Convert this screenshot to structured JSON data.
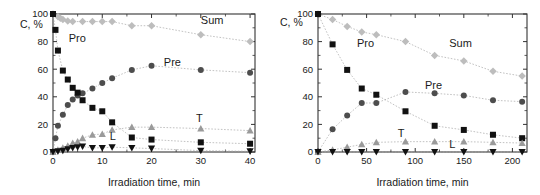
{
  "figure": {
    "background": "#ffffff",
    "panel_count": 2
  },
  "colors": {
    "pro": "#111111",
    "pre": "#4d4d4d",
    "sum": "#bdbdbd",
    "t": "#9a9a9a",
    "l": "#111111",
    "axis": "#333333",
    "connector": "#a8a8a8",
    "text": "#1a1a1a"
  },
  "series_meta": [
    {
      "key": "sum",
      "label": "Sum",
      "marker": "diamond",
      "color": "#bdbdbd"
    },
    {
      "key": "pre",
      "label": "Pre",
      "marker": "circle",
      "color": "#4d4d4d"
    },
    {
      "key": "pro",
      "label": "Pro",
      "marker": "square",
      "color": "#111111"
    },
    {
      "key": "t",
      "label": "T",
      "marker": "triangle-up",
      "color": "#9a9a9a"
    },
    {
      "key": "l",
      "label": "L",
      "marker": "triangle-down",
      "color": "#111111"
    }
  ],
  "chart_data": [
    {
      "type": "scatter",
      "panel": "left",
      "title": "",
      "xlabel": "Irradiation time, min",
      "ylabel": "C, %",
      "xlim": [
        0,
        41
      ],
      "ylim": [
        0,
        100
      ],
      "xticks": [
        0,
        10,
        20,
        30,
        40
      ],
      "yticks": [
        0,
        20,
        40,
        60,
        80,
        100
      ],
      "xtick_labels": [
        "0",
        "10",
        "20",
        "30",
        "40"
      ],
      "ytick_labels": [
        "0",
        "20",
        "40",
        "60",
        "80",
        "100"
      ],
      "grid": false,
      "legend": "inline-annotations",
      "series": [
        {
          "name": "Sum",
          "marker": "diamond",
          "color": "#bdbdbd",
          "x": [
            0,
            1,
            1.5,
            2,
            3,
            4,
            6,
            8,
            10,
            12,
            16,
            20,
            30,
            40
          ],
          "values": [
            100,
            98,
            97,
            96,
            95,
            94.5,
            94.5,
            94.5,
            94.5,
            94.5,
            91.5,
            91.5,
            85,
            80
          ]
        },
        {
          "name": "Pre",
          "marker": "circle",
          "color": "#4d4d4d",
          "x": [
            0,
            0.5,
            1,
            2,
            3,
            4,
            5,
            6,
            8,
            10,
            12,
            16,
            20,
            30,
            40
          ],
          "values": [
            0,
            10,
            19,
            27,
            34,
            38,
            41,
            42.5,
            46,
            50,
            53.5,
            59.5,
            62.5,
            59.5,
            57.5
          ]
        },
        {
          "name": "Pro",
          "marker": "square",
          "color": "#111111",
          "x": [
            0,
            0.5,
            1,
            2,
            3,
            4,
            5,
            6,
            8,
            10,
            12,
            16,
            20,
            30,
            40
          ],
          "values": [
            100,
            88.5,
            73.5,
            59,
            52.5,
            46.5,
            43,
            37.5,
            32,
            29.5,
            21.5,
            10.5,
            9,
            7,
            6
          ]
        },
        {
          "name": "T",
          "marker": "triangle-up",
          "color": "#9a9a9a",
          "x": [
            0,
            1,
            2,
            3,
            4,
            5,
            6,
            8,
            10,
            12,
            16,
            20,
            30,
            40
          ],
          "values": [
            0,
            1.5,
            3,
            4.5,
            6.5,
            7.5,
            10,
            12.5,
            13,
            16,
            18,
            18,
            17,
            15.5
          ]
        },
        {
          "name": "L",
          "marker": "triangle-down",
          "color": "#111111",
          "x": [
            0,
            1,
            2,
            3,
            4,
            5,
            6,
            8,
            10,
            12,
            16,
            20,
            30,
            40
          ],
          "values": [
            0,
            0.5,
            1,
            2,
            3,
            3.5,
            4,
            3,
            3,
            3.5,
            3,
            2.5,
            1,
            0.5
          ]
        }
      ]
    },
    {
      "type": "scatter",
      "panel": "right",
      "title": "",
      "xlabel": "Irradiation time, min",
      "ylabel": "C, %",
      "xlim": [
        0,
        215
      ],
      "ylim": [
        0,
        100
      ],
      "xticks": [
        0,
        50,
        100,
        150,
        200
      ],
      "yticks": [
        0,
        20,
        40,
        60,
        80,
        100
      ],
      "xtick_labels": [
        "0",
        "50",
        "100",
        "150",
        "200"
      ],
      "ytick_labels": [
        "0",
        "20",
        "40",
        "60",
        "80",
        "100"
      ],
      "grid": false,
      "legend": "inline-annotations",
      "series": [
        {
          "name": "Sum",
          "marker": "diamond",
          "color": "#bdbdbd",
          "x": [
            0,
            15,
            30,
            45,
            60,
            90,
            120,
            150,
            180,
            210
          ],
          "values": [
            100,
            96,
            91,
            87,
            85,
            80,
            70,
            66,
            58.5,
            55
          ]
        },
        {
          "name": "Pre",
          "marker": "circle",
          "color": "#4d4d4d",
          "x": [
            0,
            15,
            30,
            45,
            60,
            90,
            120,
            150,
            180,
            210
          ],
          "values": [
            0,
            16.5,
            26.5,
            35.5,
            35.5,
            43.5,
            42.5,
            41,
            37.5,
            36.5
          ]
        },
        {
          "name": "Pro",
          "marker": "square",
          "color": "#111111",
          "x": [
            0,
            15,
            30,
            45,
            60,
            90,
            120,
            150,
            180,
            210
          ],
          "values": [
            100,
            78,
            59.5,
            46,
            41.5,
            29.5,
            19,
            16,
            12.5,
            10
          ]
        },
        {
          "name": "T",
          "marker": "triangle-up",
          "color": "#9a9a9a",
          "x": [
            0,
            15,
            30,
            45,
            60,
            90,
            120,
            150,
            180,
            210
          ],
          "values": [
            0,
            1.5,
            3.5,
            5.5,
            7,
            7.5,
            7.5,
            7.5,
            7,
            6.5
          ]
        },
        {
          "name": "L",
          "marker": "triangle-down",
          "color": "#111111",
          "x": [
            0,
            15,
            30,
            45,
            60,
            90,
            120,
            150,
            180,
            210
          ],
          "values": [
            0,
            0,
            0,
            0,
            0,
            0,
            0,
            0,
            0,
            0
          ]
        }
      ],
      "annotations": [
        {
          "text": "Pro",
          "x": 40,
          "y": 76
        },
        {
          "text": "Sum",
          "x": 135,
          "y": 76
        },
        {
          "text": "Pre",
          "x": 110,
          "y": 46
        },
        {
          "text": "T",
          "x": 82,
          "y": 11
        },
        {
          "text": "L",
          "x": 135,
          "y": 3
        }
      ]
    }
  ],
  "left_annotations": [
    {
      "text": "Pro",
      "x": 3.2,
      "y": 80
    },
    {
      "text": "Sum",
      "x": 30,
      "y": 93
    },
    {
      "text": "Pre",
      "x": 22.5,
      "y": 62
    },
    {
      "text": "T",
      "x": 29,
      "y": 22
    },
    {
      "text": "L",
      "x": 11.5,
      "y": 9
    }
  ]
}
